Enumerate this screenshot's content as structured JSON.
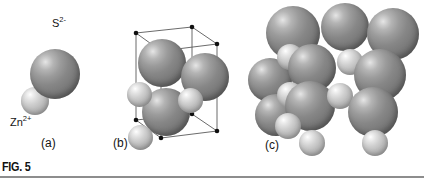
{
  "figure": {
    "number_label": "FIG. 5",
    "background_color": "#ffffff",
    "rule_color": "#8d8d8d"
  },
  "ions": {
    "anion": {
      "name": "sulfide",
      "label_text": "S",
      "label_charge": "2-",
      "color": "#7b7b7b",
      "relative_radius": 1.0
    },
    "cation": {
      "name": "zinc",
      "label_text": "Zn",
      "label_charge": "2+",
      "color": "#bdbdbd",
      "relative_radius": 0.48
    }
  },
  "panels": [
    {
      "id": "a",
      "label": "(a)",
      "description": "single anion-cation pair",
      "spheres": [
        {
          "kind": "s",
          "cx": 55.0,
          "cy": 74.0,
          "r": 25.0,
          "z": 2
        },
        {
          "kind": "zn",
          "cx": 35.0,
          "cy": 101.0,
          "r": 14.0,
          "z": 1
        }
      ],
      "ion_labels": [
        {
          "bind": "anion",
          "x": 52.0,
          "y": 17.0
        },
        {
          "bind": "cation",
          "x": 10.0,
          "y": 116.0
        }
      ],
      "label_pos": {
        "x": 41.0,
        "y": 136.0
      }
    },
    {
      "id": "b",
      "label": "(b)",
      "description": "unit cell wireframe with ions",
      "cell_stroke": "#5a5a5a",
      "vertex_color": "#101010",
      "label_pos": {
        "x": 113.0,
        "y": 136.0
      },
      "vertices": [
        {
          "x": 136.0,
          "y": 33.0
        },
        {
          "x": 192.0,
          "y": 27.0
        },
        {
          "x": 217.0,
          "y": 44.0
        },
        {
          "x": 161.0,
          "y": 51.0
        },
        {
          "x": 136.0,
          "y": 120.0
        },
        {
          "x": 192.0,
          "y": 114.0
        },
        {
          "x": 217.0,
          "y": 131.0
        },
        {
          "x": 161.0,
          "y": 138.0
        }
      ],
      "spheres": [
        {
          "kind": "s",
          "cx": 162.0,
          "cy": 63.0,
          "r": 24.0,
          "z": 3
        },
        {
          "kind": "s",
          "cx": 205.0,
          "cy": 77.0,
          "r": 24.0,
          "z": 4
        },
        {
          "kind": "s",
          "cx": 166.0,
          "cy": 112.0,
          "r": 24.0,
          "z": 5
        },
        {
          "kind": "zn",
          "cx": 139.0,
          "cy": 94.0,
          "r": 12.5,
          "z": 6
        },
        {
          "kind": "zn",
          "cx": 190.0,
          "cy": 100.0,
          "r": 12.5,
          "z": 7
        },
        {
          "kind": "zn",
          "cx": 140.0,
          "cy": 137.0,
          "r": 12.5,
          "z": 8
        }
      ]
    },
    {
      "id": "c",
      "label": "(c)",
      "description": "space-filling close-packed array",
      "label_pos": {
        "x": 265.0,
        "y": 138.0
      },
      "spheres": [
        {
          "kind": "s",
          "cx": 293.0,
          "cy": 33.0,
          "r": 27.0,
          "z": 1
        },
        {
          "kind": "s",
          "cx": 345.0,
          "cy": 27.0,
          "r": 24.0,
          "z": 2
        },
        {
          "kind": "s",
          "cx": 393.0,
          "cy": 34.0,
          "r": 26.0,
          "z": 3
        },
        {
          "kind": "zn",
          "cx": 290.0,
          "cy": 57.0,
          "r": 13.0,
          "z": 5
        },
        {
          "kind": "s",
          "cx": 312.0,
          "cy": 68.0,
          "r": 24.0,
          "z": 6
        },
        {
          "kind": "zn",
          "cx": 350.0,
          "cy": 62.0,
          "r": 13.0,
          "z": 7
        },
        {
          "kind": "s",
          "cx": 380.0,
          "cy": 75.0,
          "r": 26.0,
          "z": 8
        },
        {
          "kind": "zn",
          "cx": 290.0,
          "cy": 95.0,
          "r": 13.0,
          "z": 10
        },
        {
          "kind": "s",
          "cx": 310.0,
          "cy": 106.0,
          "r": 25.0,
          "z": 11
        },
        {
          "kind": "zn",
          "cx": 340.0,
          "cy": 96.0,
          "r": 13.0,
          "z": 12
        },
        {
          "kind": "s",
          "cx": 373.0,
          "cy": 112.0,
          "r": 25.0,
          "z": 13
        },
        {
          "kind": "zn",
          "cx": 288.0,
          "cy": 126.0,
          "r": 13.0,
          "z": 15
        },
        {
          "kind": "zn",
          "cx": 312.0,
          "cy": 143.0,
          "r": 13.0,
          "z": 16
        },
        {
          "kind": "zn",
          "cx": 375.0,
          "cy": 143.0,
          "r": 13.0,
          "z": 17
        },
        {
          "kind": "s",
          "cx": 270.0,
          "cy": 80.0,
          "r": 22.0,
          "z": 4
        },
        {
          "kind": "s",
          "cx": 276.0,
          "cy": 115.0,
          "r": 21.0,
          "z": 9
        }
      ]
    }
  ]
}
